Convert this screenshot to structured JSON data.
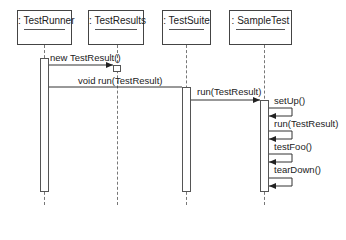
{
  "diagram": {
    "type": "UML sequence diagram",
    "objects": [
      {
        "label": ": TestRunner"
      },
      {
        "label": ": TestResults"
      },
      {
        "label": ": TestSuite"
      },
      {
        "label": ": SampleTest"
      }
    ],
    "messages": [
      {
        "label": "new TestResult()",
        "from": ": TestRunner",
        "to": ": TestResults"
      },
      {
        "label": "void run(TestResult)",
        "from": ": TestRunner",
        "to": ": TestSuite"
      },
      {
        "label": "run(TestResult)",
        "from": ": TestSuite",
        "to": ": SampleTest"
      },
      {
        "label": "setUp()",
        "from": ": SampleTest",
        "to": ": SampleTest"
      },
      {
        "label": "run(TestResult)",
        "from": ": SampleTest",
        "to": ": SampleTest"
      },
      {
        "label": "testFoo()",
        "from": ": SampleTest",
        "to": ": SampleTest"
      },
      {
        "label": "tearDown()",
        "from": ": SampleTest",
        "to": ": SampleTest"
      }
    ]
  }
}
